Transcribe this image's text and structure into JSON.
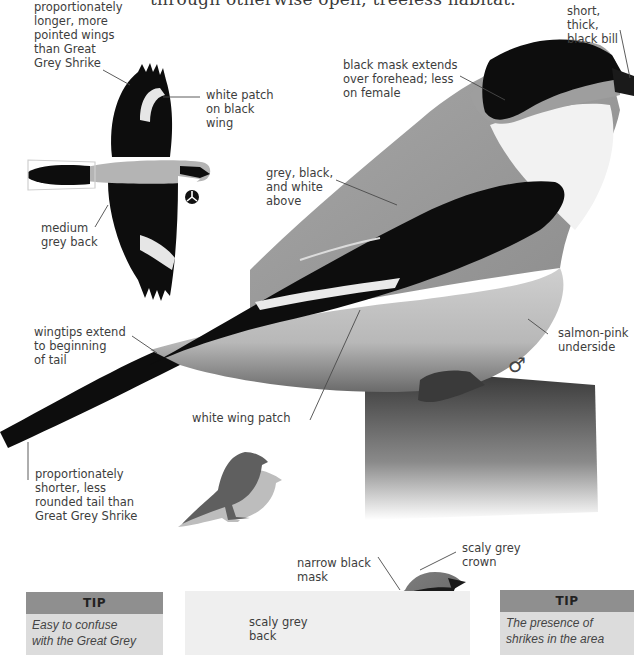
{
  "page": {
    "header_fragment": "through otherwise open, treeless habitat.",
    "species": "Lesser Grey Shrike"
  },
  "flight_illustration": {
    "labels": {
      "wings": "proportionately\nlonger, more\npointed wings\nthan Great\nGrey Shrike",
      "white_patch": "white patch\non black\nwing",
      "back": "medium\ngrey back"
    },
    "symbol": "flight-view-symbol"
  },
  "main_illustration": {
    "labels": {
      "bill": "short, thick,\nblack bill",
      "mask": "black mask extends\nover forehead; less\non female",
      "above": "grey, black,\nand white\nabove",
      "wingtips": "wingtips extend\nto beginning\nof tail",
      "underside": "salmon-pink\nunderside",
      "wing_patch": "white wing patch",
      "tail": "proportionately\nshorter, less\nrounded tail than\nGreat Grey Shrike"
    },
    "sex_symbol": "♂"
  },
  "size_comparison": {
    "description": "silhouette size comparison"
  },
  "juvenile_inset": {
    "labels": {
      "mask": "narrow black\nmask",
      "crown": "scaly grey\ncrown",
      "back": "scaly grey\nback"
    }
  },
  "tips": [
    {
      "title": "TIP",
      "text": "Easy to confuse\nwith the Great Grey"
    },
    {
      "title": "TIP",
      "text": "The presence of\nshrikes in the area"
    }
  ],
  "colors": {
    "tip_header": "#8f8f8f",
    "tip_body": "#dcdcdc",
    "text": "#3d3d3d",
    "bird_black": "#0d0d0d",
    "bird_grey": "#9a9a9a"
  }
}
